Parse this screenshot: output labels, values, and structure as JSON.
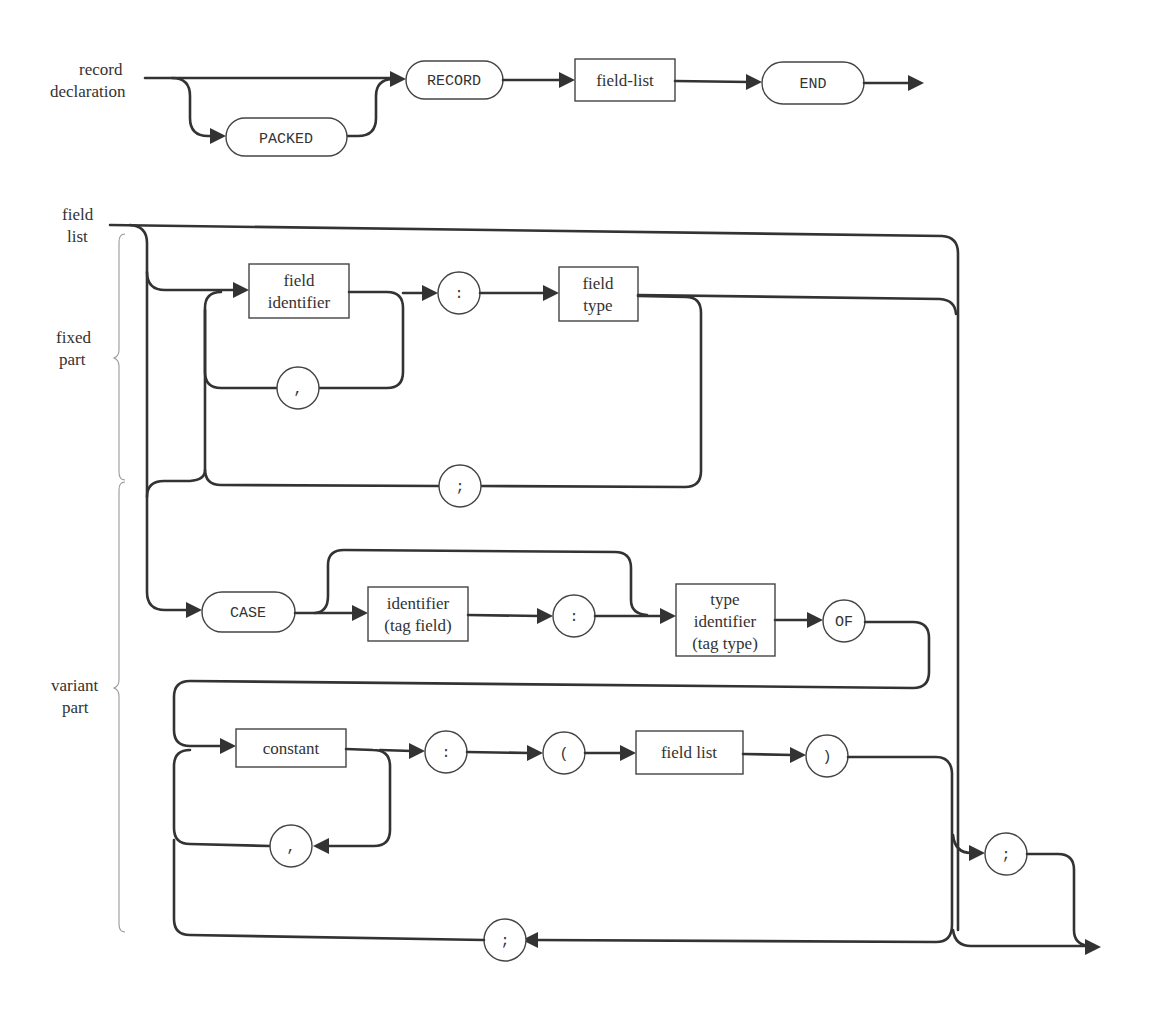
{
  "diagram": {
    "type": "syntax-diagram",
    "colors": {
      "line": "#333333",
      "shape_border": "#444444",
      "brace": "#999999",
      "background": "#ffffff"
    },
    "record_declaration": {
      "entry_label_line1": "record",
      "entry_label_line2": "declaration",
      "nodes": {
        "packed": "PACKED",
        "record": "RECORD",
        "field_list": "field-list",
        "end": "END"
      }
    },
    "field_list": {
      "entry_label_line1": "field",
      "entry_label_line2": "list",
      "braces": {
        "fixed_line1": "fixed",
        "fixed_line2": "part",
        "variant_line1": "variant",
        "variant_line2": "part"
      },
      "fixed_part": {
        "field_identifier_line1": "field",
        "field_identifier_line2": "identifier",
        "comma": ",",
        "colon": ":",
        "field_type_line1": "field",
        "field_type_line2": "type",
        "semicolon": ";"
      },
      "variant_part": {
        "case": "CASE",
        "identifier_line1": "identifier",
        "identifier_line2": "(tag field)",
        "colon": ":",
        "type_identifier_line1": "type",
        "type_identifier_line2": "identifier",
        "type_identifier_line3": "(tag type)",
        "of": "OF",
        "constant": "constant",
        "constant_comma": ",",
        "colon2": ":",
        "open_paren": "(",
        "field_list": "field list",
        "close_paren": ")",
        "variant_semicolon": ";",
        "exit_semicolon": ";"
      }
    }
  }
}
